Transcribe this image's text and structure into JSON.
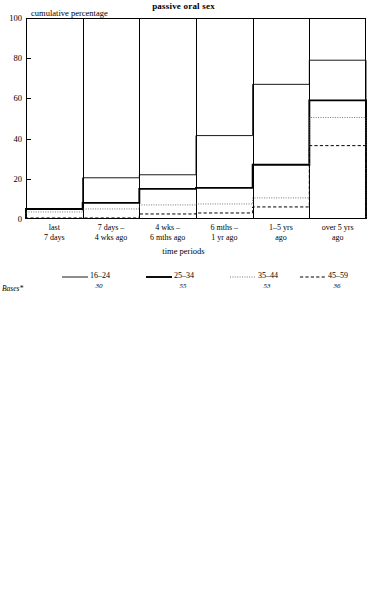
{
  "panels": [
    {
      "title": "passive oral sex",
      "ylabel": "cumulative percentage",
      "xlabel": "time periods",
      "bases_label": "Bases*",
      "yticks": [
        "0",
        "20",
        "40",
        "60",
        "80",
        "100"
      ],
      "categories_l1": [
        "last",
        "7 days –",
        "4 wks –",
        "6 mths –",
        "1–5 yrs",
        "over 5 yrs"
      ],
      "categories_l2": [
        "7 days",
        "4 wks ago",
        "6 mths ago",
        "1 yr ago",
        "ago",
        "ago"
      ],
      "legend": [
        {
          "label": "16–24",
          "base": "30",
          "style": "thin-solid"
        },
        {
          "label": "25–34",
          "base": "55",
          "style": "thick-solid"
        },
        {
          "label": "35–44",
          "base": "53",
          "style": "dotted"
        },
        {
          "label": "45–59",
          "base": "36",
          "style": "dashed"
        }
      ],
      "chart_data": {
        "type": "line",
        "title": "passive oral sex",
        "xlabel": "time periods",
        "ylabel": "cumulative percentage",
        "ylim": [
          0,
          100
        ],
        "grid": false,
        "legend_position": "below",
        "categories": [
          "last 7 days",
          "7 days – 4 wks ago",
          "4 wks – 6 mths ago",
          "6 mths – 1 yr ago",
          "1–5 yrs ago",
          "over 5 yrs ago"
        ],
        "series": [
          {
            "name": "16–24",
            "base": 30,
            "values": [
              5,
              20.5,
              22,
              41.5,
              67,
              79
            ]
          },
          {
            "name": "25–34",
            "base": 55,
            "values": [
              5,
              8,
              15,
              15.5,
              27,
              59
            ]
          },
          {
            "name": "35–44",
            "base": 53,
            "values": [
              3.5,
              5,
              7,
              7.5,
              10.5,
              50.5
            ]
          },
          {
            "name": "45–59",
            "base": 36,
            "values": [
              0.5,
              0.5,
              2.5,
              3,
              6,
              36.5
            ]
          }
        ]
      }
    },
    {
      "title": "active oral sex",
      "ylabel": "cumulative percentage",
      "xlabel": "time periods",
      "bases_label": "Bases*",
      "yticks": [
        "0",
        "20",
        "40",
        "60",
        "80",
        "100"
      ],
      "categories_l1": [
        "last",
        "7 days –",
        "4 wks –",
        "6 mths –",
        "1–5 yrs",
        "over 5 yrs"
      ],
      "categories_l2": [
        "7 days",
        "4 wks ago",
        "6 mths ago",
        "1 yr ago",
        "ago",
        "ago"
      ],
      "legend": [
        {
          "label": "16–24",
          "base": "30",
          "style": "thin-solid"
        },
        {
          "label": "25–34",
          "base": "54",
          "style": "thick-solid"
        },
        {
          "label": "35–44",
          "base": "53",
          "style": "dotted"
        },
        {
          "label": "45–59",
          "base": "36",
          "style": "dashed"
        }
      ],
      "chart_data": {
        "type": "line",
        "title": "active oral sex",
        "xlabel": "time periods",
        "ylabel": "cumulative percentage",
        "ylim": [
          0,
          100
        ],
        "grid": false,
        "legend_position": "below",
        "categories": [
          "last 7 days",
          "7 days – 4 wks ago",
          "4 wks – 6 mths ago",
          "6 mths – 1 yr ago",
          "1–5 yrs ago",
          "over 5 yrs ago"
        ],
        "series": [
          {
            "name": "16–24",
            "base": 30,
            "values": [
              5,
              12.5,
              22,
              29.5,
              58.5,
              67
            ]
          },
          {
            "name": "25–34",
            "base": 54,
            "values": [
              8.5,
              9.5,
              16.5,
              23,
              31.5,
              57
            ]
          },
          {
            "name": "35–44",
            "base": 53,
            "values": [
              3,
              3,
              7,
              9,
              13,
              53
            ]
          },
          {
            "name": "45–59",
            "base": 36,
            "values": [
              0.5,
              0.5,
              1.5,
              1.5,
              5,
              34.5
            ]
          }
        ]
      }
    }
  ]
}
